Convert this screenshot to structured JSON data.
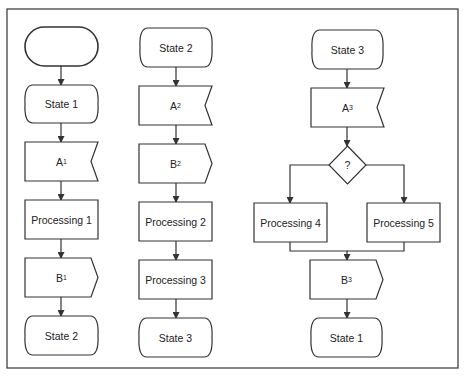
{
  "colors": {
    "stroke": "#333333",
    "background": "#ffffff",
    "text": "#222222"
  },
  "frame": {
    "x": 7,
    "y": 9,
    "w": 451,
    "h": 359
  },
  "columns": [
    {
      "id": "col1",
      "nodes": [
        {
          "id": "start",
          "type": "terminator",
          "label": "",
          "sub": "",
          "x": 25,
          "y": 27,
          "w": 73,
          "h": 39
        },
        {
          "id": "state1",
          "type": "state",
          "label": "State 1",
          "sub": "",
          "x": 25,
          "y": 85,
          "w": 73,
          "h": 38
        },
        {
          "id": "a1",
          "type": "input-notch",
          "label": "A",
          "sub": "1",
          "x": 25,
          "y": 142,
          "w": 73,
          "h": 39
        },
        {
          "id": "proc1",
          "type": "process",
          "label": "Processing 1",
          "sub": "",
          "x": 25,
          "y": 200,
          "w": 73,
          "h": 39
        },
        {
          "id": "b1",
          "type": "output-point",
          "label": "B",
          "sub": "1",
          "x": 25,
          "y": 258,
          "w": 73,
          "h": 39
        },
        {
          "id": "state2_end",
          "type": "state",
          "label": "State 2",
          "sub": "",
          "x": 25,
          "y": 316,
          "w": 73,
          "h": 39
        }
      ]
    },
    {
      "id": "col2",
      "nodes": [
        {
          "id": "state2",
          "type": "state",
          "label": "State 2",
          "sub": "",
          "x": 140,
          "y": 28,
          "w": 72,
          "h": 39
        },
        {
          "id": "a2",
          "type": "input-notch",
          "label": "A",
          "sub": "2",
          "x": 139,
          "y": 86,
          "w": 73,
          "h": 39
        },
        {
          "id": "b2",
          "type": "output-point",
          "label": "B",
          "sub": "2",
          "x": 139,
          "y": 144,
          "w": 73,
          "h": 39
        },
        {
          "id": "proc2",
          "type": "process",
          "label": "Processing 2",
          "sub": "",
          "x": 139,
          "y": 202,
          "w": 73,
          "h": 39
        },
        {
          "id": "proc3",
          "type": "process",
          "label": "Processing 3",
          "sub": "",
          "x": 139,
          "y": 260,
          "w": 73,
          "h": 39
        },
        {
          "id": "state3_end",
          "type": "state",
          "label": "State 3",
          "sub": "",
          "x": 139,
          "y": 318,
          "w": 73,
          "h": 39
        }
      ]
    },
    {
      "id": "col3",
      "nodes": [
        {
          "id": "state3",
          "type": "state",
          "label": "State 3",
          "sub": "",
          "x": 312,
          "y": 30,
          "w": 71,
          "h": 39
        },
        {
          "id": "a3",
          "type": "input-notch",
          "label": "A",
          "sub": "3",
          "x": 311,
          "y": 88,
          "w": 73,
          "h": 39
        },
        {
          "id": "decision",
          "type": "decision",
          "label": "?",
          "sub": "",
          "x": 329,
          "y": 146,
          "w": 37,
          "h": 38
        },
        {
          "id": "proc4",
          "type": "process",
          "label": "Processing 4",
          "sub": "",
          "x": 254,
          "y": 203,
          "w": 73,
          "h": 39
        },
        {
          "id": "proc5",
          "type": "process",
          "label": "Processing 5",
          "sub": "",
          "x": 367,
          "y": 203,
          "w": 73,
          "h": 39
        },
        {
          "id": "b3",
          "type": "output-point",
          "label": "B",
          "sub": "3",
          "x": 310,
          "y": 260,
          "w": 73,
          "h": 39
        },
        {
          "id": "state1_end",
          "type": "state",
          "label": "State 1",
          "sub": "",
          "x": 311,
          "y": 318,
          "w": 71,
          "h": 39
        }
      ]
    }
  ],
  "edges": [
    {
      "from": "start",
      "to": "state1",
      "points": [
        [
          61,
          66
        ],
        [
          61,
          85
        ]
      ]
    },
    {
      "from": "state1",
      "to": "a1",
      "points": [
        [
          61,
          123
        ],
        [
          61,
          142
        ]
      ]
    },
    {
      "from": "a1",
      "to": "proc1",
      "points": [
        [
          61,
          181
        ],
        [
          61,
          200
        ]
      ]
    },
    {
      "from": "proc1",
      "to": "b1",
      "points": [
        [
          61,
          239
        ],
        [
          61,
          258
        ]
      ]
    },
    {
      "from": "b1",
      "to": "state2_end",
      "points": [
        [
          61,
          297
        ],
        [
          61,
          316
        ]
      ]
    },
    {
      "from": "state2",
      "to": "a2",
      "points": [
        [
          176,
          67
        ],
        [
          176,
          86
        ]
      ]
    },
    {
      "from": "a2",
      "to": "b2",
      "points": [
        [
          176,
          125
        ],
        [
          176,
          144
        ]
      ]
    },
    {
      "from": "b2",
      "to": "proc2",
      "points": [
        [
          176,
          183
        ],
        [
          176,
          202
        ]
      ]
    },
    {
      "from": "proc2",
      "to": "proc3",
      "points": [
        [
          176,
          241
        ],
        [
          176,
          260
        ]
      ]
    },
    {
      "from": "proc3",
      "to": "state3_end",
      "points": [
        [
          176,
          299
        ],
        [
          176,
          318
        ]
      ]
    },
    {
      "from": "state3",
      "to": "a3",
      "points": [
        [
          347,
          69
        ],
        [
          347,
          88
        ]
      ]
    },
    {
      "from": "a3",
      "to": "decision",
      "points": [
        [
          347,
          127
        ],
        [
          347,
          146
        ]
      ]
    },
    {
      "from": "decision",
      "to": "proc4",
      "points": [
        [
          329,
          165
        ],
        [
          290,
          165
        ],
        [
          290,
          203
        ]
      ]
    },
    {
      "from": "decision",
      "to": "proc5",
      "points": [
        [
          366,
          165
        ],
        [
          404,
          165
        ],
        [
          404,
          203
        ]
      ]
    },
    {
      "from": "proc4",
      "to": "b3",
      "points": [
        [
          290,
          242
        ],
        [
          290,
          251
        ],
        [
          347,
          251
        ],
        [
          347,
          260
        ]
      ]
    },
    {
      "from": "proc5",
      "to": "b3",
      "points": [
        [
          404,
          242
        ],
        [
          404,
          251
        ],
        [
          347,
          251
        ]
      ],
      "arrow": false
    },
    {
      "from": "b3",
      "to": "state1_end",
      "points": [
        [
          347,
          299
        ],
        [
          347,
          318
        ]
      ]
    }
  ]
}
